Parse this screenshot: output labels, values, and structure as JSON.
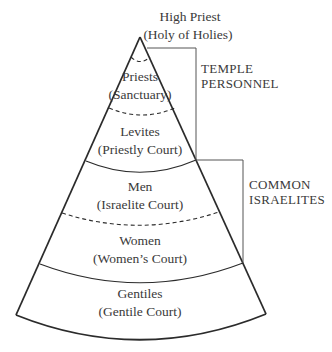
{
  "diagram": {
    "stroke_color": "#2b2b2b",
    "levels": [
      {
        "name": "High Priest",
        "place": "(Holy of Holies)"
      },
      {
        "name": "Priests",
        "place": "(Sanctuary)"
      },
      {
        "name": "Levites",
        "place": "(Priestly Court)"
      },
      {
        "name": "Men",
        "place": "(Israelite Court)"
      },
      {
        "name": "Women",
        "place": "(Women’s Court)"
      },
      {
        "name": "Gentiles",
        "place": "(Gentile Court)"
      }
    ],
    "groups": [
      {
        "line1": "TEMPLE",
        "line2": "PERSONNEL"
      },
      {
        "line1": "COMMON",
        "line2": "ISRAELITES"
      }
    ]
  }
}
